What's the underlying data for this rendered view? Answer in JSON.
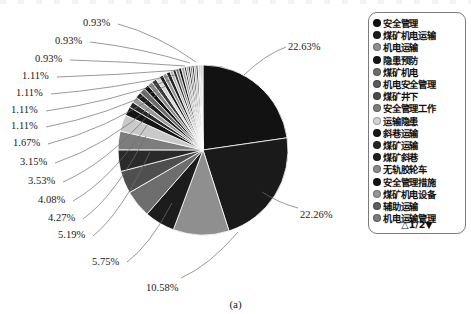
{
  "caption": "(a)",
  "legend": {
    "pager": "△1/2▼",
    "items": [
      {
        "label": "安全管理",
        "color": "#101010"
      },
      {
        "label": "煤矿机电运输",
        "color": "#1c1c1c"
      },
      {
        "label": "机电运输",
        "color": "#8f8f8f"
      },
      {
        "label": "隐患预防",
        "color": "#141414"
      },
      {
        "label": "煤矿机电",
        "color": "#6e6e6e"
      },
      {
        "label": "机电安全管理",
        "color": "#5a5a5a"
      },
      {
        "label": "煤矿井下",
        "color": "#4a4a4a"
      },
      {
        "label": "安全管理工作",
        "color": "#7d7d7d"
      },
      {
        "label": "运输隐患",
        "color": "#d2d2d2"
      },
      {
        "label": "斜巷运输",
        "color": "#161616"
      },
      {
        "label": "煤矿运输",
        "color": "#262626"
      },
      {
        "label": "煤矿斜巷",
        "color": "#1e1e1e"
      },
      {
        "label": "无轨胶轮车",
        "color": "#8a8a8a"
      },
      {
        "label": "安全管理措施",
        "color": "#121212"
      },
      {
        "label": "煤矿机电设备",
        "color": "#969696"
      },
      {
        "label": "辅助运输",
        "color": "#5e5e5e"
      },
      {
        "label": "机电运输管理",
        "color": "#7a7a7a"
      }
    ]
  },
  "chart_data": {
    "type": "pie",
    "title": "",
    "start_angle_deg": 0,
    "direction": "clockwise",
    "center": [
      203,
      150
    ],
    "radius": 85,
    "labels_shown": [
      "22.63%",
      "22.26%",
      "10.58%",
      "5.75%",
      "5.19%",
      "4.27%",
      "4.08%",
      "3.53%",
      "3.15%",
      "1.67%",
      "1.11%",
      "1.11%",
      "1.11%",
      "1.11%",
      "0.93%",
      "0.93%",
      "0.93%"
    ],
    "categories": [
      "安全管理",
      "煤矿机电运输",
      "机电运输",
      "隐患预防",
      "煤矿机电",
      "机电安全管理",
      "煤矿井下",
      "安全管理工作",
      "运输隐患",
      "斜巷运输",
      "煤矿运输",
      "煤矿斜巷",
      "无轨胶轮车",
      "安全管理措施",
      "煤矿机电设备",
      "辅助运输",
      "机电运输管理",
      "其他18",
      "其他19",
      "其他20",
      "其他21",
      "其他22",
      "其他23",
      "其他24",
      "其他25",
      "其他26",
      "其他27",
      "其他28",
      "其他29",
      "其他30",
      "其他31",
      "其他32",
      "其他33",
      "其他34",
      "其他35",
      "其他36",
      "其他37",
      "其他38"
    ],
    "values": [
      22.63,
      22.26,
      10.58,
      5.75,
      5.19,
      4.27,
      4.08,
      3.53,
      3.15,
      1.67,
      1.11,
      1.11,
      1.11,
      1.11,
      0.93,
      0.93,
      0.93,
      0.74,
      0.74,
      0.74,
      0.74,
      0.56,
      0.56,
      0.56,
      0.56,
      0.56,
      0.37,
      0.37,
      0.37,
      0.37,
      0.37,
      0.37,
      0.37,
      0.19,
      0.19,
      0.19,
      0.19,
      0.19
    ],
    "colors": [
      "#121212",
      "#1a1a1a",
      "#8f8f8f",
      "#1c1c1c",
      "#6e6e6e",
      "#4f4f4f",
      "#2a2a2a",
      "#7d7d7d",
      "#c9c9c9",
      "#161616",
      "#272727",
      "#9a9a9a",
      "#1e1e1e",
      "#6a6a6a",
      "#111111",
      "#8a8a8a",
      "#3a3a3a",
      "#d8d8d8",
      "#1a1a1a",
      "#909090",
      "#202020",
      "#b4b4b4",
      "#2c2c2c",
      "#7e7e7e",
      "#151515",
      "#a2a2a2",
      "#242424",
      "#8c8c8c",
      "#131313",
      "#6f6f6f",
      "#1f1f1f",
      "#9e9e9e",
      "#2e2e2e",
      "#c0c0c0",
      "#181818",
      "#868686",
      "#222222",
      "#aaaaaa"
    ],
    "legend_position": "right",
    "grid": false
  },
  "pct_labels": [
    {
      "text": "0.93%",
      "x": 83,
      "y": 18,
      "align": "left"
    },
    {
      "text": "0.93%",
      "x": 55,
      "y": 36,
      "align": "left"
    },
    {
      "text": "0.93%",
      "x": 35,
      "y": 54,
      "align": "left"
    },
    {
      "text": "1.11%",
      "x": 22,
      "y": 71,
      "align": "left"
    },
    {
      "text": "1.11%",
      "x": 16,
      "y": 88,
      "align": "left"
    },
    {
      "text": "1.11%",
      "x": 11,
      "y": 105,
      "align": "left"
    },
    {
      "text": "1.11%",
      "x": 11,
      "y": 121,
      "align": "left"
    },
    {
      "text": "1.67%",
      "x": 13,
      "y": 138,
      "align": "left"
    },
    {
      "text": "3.15%",
      "x": 20,
      "y": 157,
      "align": "left"
    },
    {
      "text": "3.53%",
      "x": 28,
      "y": 176,
      "align": "left"
    },
    {
      "text": "4.08%",
      "x": 38,
      "y": 195,
      "align": "left"
    },
    {
      "text": "4.27%",
      "x": 48,
      "y": 213,
      "align": "left"
    },
    {
      "text": "5.19%",
      "x": 58,
      "y": 230,
      "align": "left"
    },
    {
      "text": "5.75%",
      "x": 92,
      "y": 257,
      "align": "left"
    },
    {
      "text": "10.58%",
      "x": 146,
      "y": 283,
      "align": "left"
    },
    {
      "text": "22.63%",
      "x": 288,
      "y": 42,
      "align": "left"
    },
    {
      "text": "22.26%",
      "x": 300,
      "y": 210,
      "align": "left"
    }
  ],
  "leaders": [
    {
      "from": [
        118,
        24
      ],
      "to": [
        196,
        62
      ]
    },
    {
      "from": [
        90,
        42
      ],
      "to": [
        190,
        63
      ]
    },
    {
      "from": [
        70,
        60
      ],
      "to": [
        185,
        66
      ]
    },
    {
      "from": [
        57,
        77
      ],
      "to": [
        180,
        70
      ]
    },
    {
      "from": [
        51,
        94
      ],
      "to": [
        175,
        75
      ]
    },
    {
      "from": [
        46,
        111
      ],
      "to": [
        170,
        80
      ]
    },
    {
      "from": [
        46,
        127
      ],
      "to": [
        166,
        86
      ]
    },
    {
      "from": [
        48,
        144
      ],
      "to": [
        162,
        92
      ]
    },
    {
      "from": [
        55,
        163
      ],
      "to": [
        155,
        103
      ]
    },
    {
      "from": [
        63,
        182
      ],
      "to": [
        150,
        113
      ]
    },
    {
      "from": [
        73,
        201
      ],
      "to": [
        148,
        124
      ]
    },
    {
      "from": [
        83,
        219
      ],
      "to": [
        146,
        136
      ]
    },
    {
      "from": [
        93,
        236
      ],
      "to": [
        150,
        152
      ]
    },
    {
      "from": [
        127,
        262
      ],
      "to": [
        172,
        203
      ]
    },
    {
      "from": [
        181,
        278
      ],
      "to": [
        238,
        232
      ]
    },
    {
      "from": [
        286,
        47
      ],
      "to": [
        244,
        75
      ]
    },
    {
      "from": [
        298,
        208
      ],
      "to": [
        262,
        192
      ]
    }
  ]
}
